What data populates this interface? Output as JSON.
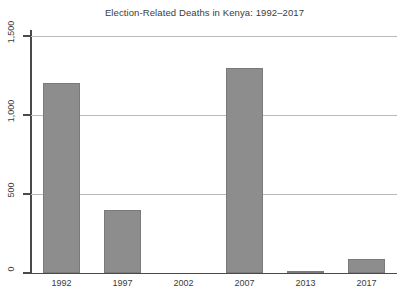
{
  "chart_data": {
    "type": "bar",
    "title": "Election-Related Deaths in Kenya: 1992–2017",
    "xlabel": "",
    "ylabel": "",
    "categories": [
      "1992",
      "1997",
      "2002",
      "2007",
      "2013",
      "2017"
    ],
    "values": [
      1200,
      400,
      0,
      1300,
      13,
      90
    ],
    "ylim": [
      0,
      1500
    ],
    "yticks": [
      0,
      500,
      1000,
      1500
    ],
    "ytick_labels": [
      "0",
      "500",
      "1,000",
      "1,500"
    ],
    "ytick_label_rotation": 90,
    "grid": true,
    "grid_axis": "y",
    "legend": false,
    "legend_position": "none",
    "bar_color": "#8d8d8d",
    "bar_edge_color": "#7a7a7a",
    "gridline_color": "#b9b9b9",
    "axis_color": "#4a4a4a",
    "text_color": "#3b3b3b",
    "background_color": "#ffffff"
  },
  "caption_fragment": ""
}
